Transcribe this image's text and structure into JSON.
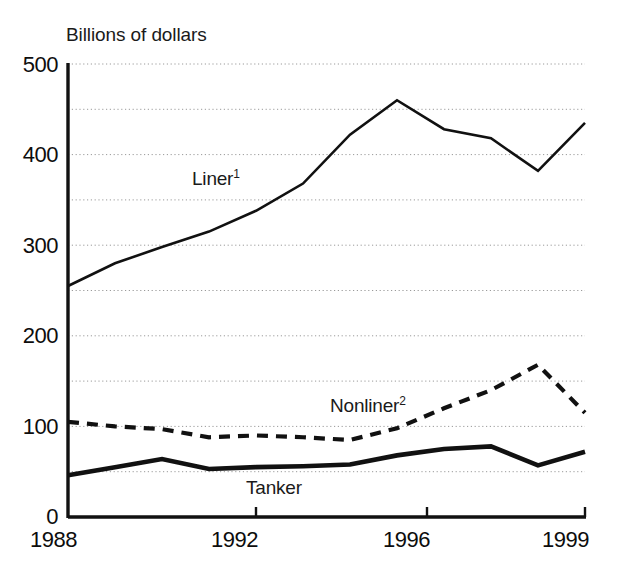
{
  "chart_data": {
    "type": "line",
    "title": "",
    "ylabel": "Billions of dollars",
    "xlabel": "",
    "ylim": [
      0,
      500
    ],
    "xlim": [
      1988,
      1999
    ],
    "grid": true,
    "grid_style": "dotted horizontal",
    "grid_interval": 50,
    "legend": "inline labels on series",
    "x": [
      1988,
      1989,
      1990,
      1991,
      1992,
      1993,
      1994,
      1995,
      1996,
      1997,
      1998,
      1999
    ],
    "y_ticks": [
      0,
      100,
      200,
      300,
      400,
      500
    ],
    "y_tick_labels": [
      "0",
      "100",
      "200",
      "300",
      "400",
      "500"
    ],
    "x_ticks": [
      1988,
      1992,
      1996,
      1999
    ],
    "x_tick_labels": [
      "1988",
      "1992",
      "1996",
      "1999"
    ],
    "series": [
      {
        "name": "Liner",
        "label": "Liner",
        "footnote": "1",
        "style": "solid",
        "line_width": 2.6,
        "color": "#111111",
        "values": [
          255,
          280,
          298,
          315,
          338,
          368,
          422,
          460,
          428,
          418,
          382,
          435
        ]
      },
      {
        "name": "Nonliner",
        "label": "Nonliner",
        "footnote": "2",
        "style": "dashed",
        "line_width": 4.2,
        "color": "#111111",
        "values": [
          105,
          100,
          97,
          88,
          90,
          88,
          85,
          98,
          120,
          140,
          168,
          115
        ]
      },
      {
        "name": "Tanker",
        "label": "Tanker",
        "footnote": "",
        "style": "solid",
        "line_width": 4.6,
        "color": "#111111",
        "values": [
          46,
          55,
          64,
          53,
          55,
          56,
          58,
          68,
          75,
          78,
          57,
          72
        ]
      }
    ]
  },
  "axis": {
    "y_title": "Billions of dollars",
    "y_labels": [
      "500",
      "400",
      "300",
      "200",
      "100",
      "0"
    ],
    "x_labels": [
      "1988",
      "1992",
      "1996",
      "1999"
    ]
  },
  "annotations": {
    "liner_label": "Liner",
    "liner_sup": "1",
    "nonliner_label": "Nonliner",
    "nonliner_sup": "2",
    "tanker_label": "Tanker"
  },
  "colors": {
    "ink": "#111111",
    "grid": "#9a9a9a",
    "background": "#ffffff"
  }
}
